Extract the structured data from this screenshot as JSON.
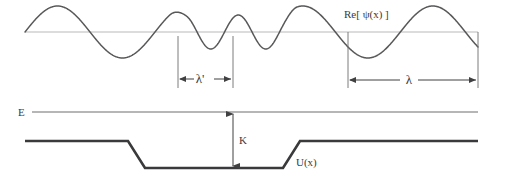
{
  "figure": {
    "background_color": "#ffffff"
  },
  "labels": {
    "wavefunction": "Re[ ψ(x) ]",
    "lambda_short": "λ'",
    "lambda_long": "λ",
    "energy": "E",
    "kinetic": "K",
    "potential": "U(x)"
  },
  "colors": {
    "wave_stroke": "#58585a",
    "wave_axis": "#b9b9bb",
    "energy_line": "#6e6e70",
    "potential_stroke": "#3a3a3c",
    "dimension_line": "#404042",
    "text": "#3a3a3c"
  },
  "chart_data": {
    "type": "line",
    "xlabel": "x",
    "ylabel": "",
    "grid": false,
    "legend": null,
    "xlim": [
      0,
      505
    ],
    "ylim": [
      0,
      184
    ],
    "annotations": [
      {
        "name": "wavefunction-label",
        "text": "Re[ ψ(x) ]",
        "x": 344,
        "y": 18
      },
      {
        "name": "lambda-short-label",
        "text": "λ'",
        "x": 200,
        "y": 79
      },
      {
        "name": "lambda-long-label",
        "text": "λ",
        "x": 409,
        "y": 80
      },
      {
        "name": "energy-label",
        "text": "E",
        "x": 22,
        "y": 116
      },
      {
        "name": "kinetic-label",
        "text": "K",
        "x": 239,
        "y": 144
      },
      {
        "name": "potential-label",
        "text": "U(x)",
        "x": 296,
        "y": 166
      }
    ],
    "series": [
      {
        "name": "Re[psi(x)]",
        "description": "Oscillating real part of the wavefunction; long wavelength outside the well, short wavelength inside the well",
        "axis_y": 32,
        "x_start": 25,
        "x_end": 478,
        "segments": [
          {
            "region": "outside-left",
            "wavelength": 130,
            "amplitude": 26,
            "x_from": 25,
            "x_to": 178
          },
          {
            "region": "inside-well",
            "wavelength": 55,
            "amplitude": 17,
            "x_from": 178,
            "x_to": 288
          },
          {
            "region": "outside-right",
            "wavelength": 130,
            "amplitude": 26,
            "x_from": 288,
            "x_to": 478
          }
        ]
      },
      {
        "name": "E",
        "description": "Total energy level, horizontal line",
        "y": 112,
        "x_from": 32,
        "x_to": 478
      },
      {
        "name": "U(x)",
        "description": "Finite square potential well with sloped walls",
        "outer_level_y": 141,
        "well_bottom_y": 168,
        "x_from": 25,
        "x_to": 478,
        "left_wall_top_x": 128,
        "left_wall_bottom_x": 145,
        "right_wall_bottom_x": 283,
        "right_wall_top_x": 300
      }
    ],
    "dimensions": [
      {
        "name": "lambda-short",
        "label": "λ'",
        "y": 79,
        "x_from": 178,
        "x_to": 233,
        "tick_top_y": 36,
        "meaning": "wavelength inside the well (shorter)"
      },
      {
        "name": "lambda-long",
        "label": "λ",
        "y": 80,
        "x_from": 348,
        "x_to": 478,
        "tick_top_y": 32,
        "meaning": "wavelength outside the well (longer)"
      },
      {
        "name": "kinetic-energy",
        "label": "K",
        "x": 233,
        "y_from": 112,
        "y_to": 168,
        "meaning": "kinetic energy = E - U inside the well"
      }
    ]
  }
}
